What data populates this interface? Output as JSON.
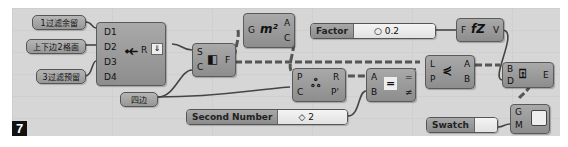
{
  "figure_number": "7",
  "panels": [
    {
      "id": "p1",
      "text": "1过滤余留"
    },
    {
      "id": "p2",
      "text": "上下边2格面"
    },
    {
      "id": "p3",
      "text": "3过滤预留"
    },
    {
      "id": "p4",
      "text": "四边"
    }
  ],
  "nodes": {
    "dispatch": {
      "inputs": [
        "D1",
        "D2",
        "D3",
        "D4"
      ],
      "outputs": [
        "R"
      ],
      "icon": "merge-icon"
    },
    "explode": {
      "inputs": [
        "S",
        "C"
      ],
      "outputs": [
        "F"
      ],
      "icon": "surface-split-icon"
    },
    "area": {
      "inputs": [
        "G"
      ],
      "outputs": [
        "A",
        "C"
      ],
      "icon": "m²"
    },
    "pull": {
      "inputs": [
        "P",
        "C"
      ],
      "outputs": [
        "R",
        "P'"
      ],
      "icon": "pull-point-icon"
    },
    "equality": {
      "inputs": [
        "A",
        "B"
      ],
      "outputs": [
        "=",
        "≠"
      ],
      "icon": "="
    },
    "cull": {
      "inputs": [
        "L",
        "P"
      ],
      "outputs": [
        "A",
        "B"
      ],
      "icon": "split-list-icon"
    },
    "scale": {
      "inputs": [
        "F"
      ],
      "outputs": [
        "V"
      ],
      "icon": "fZ"
    },
    "extrude": {
      "inputs": [
        "B",
        "D"
      ],
      "outputs": [
        "E"
      ],
      "icon": "extrude-icon"
    },
    "preview": {
      "inputs": [
        "G",
        "M"
      ],
      "outputs": [],
      "icon": "preview-icon"
    }
  },
  "sliders": {
    "factor": {
      "label": "Factor",
      "value": "0.2"
    },
    "second": {
      "label": "Second Number",
      "value": "2"
    },
    "swatch": {
      "label": "Swatch",
      "value": ""
    }
  },
  "colors": {
    "canvas": "#d6d6d6",
    "node": "#9a9a9a",
    "wire": "#444444",
    "badge": "#111111"
  }
}
